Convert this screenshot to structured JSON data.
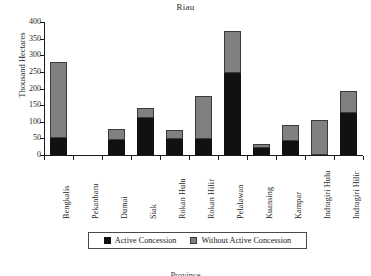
{
  "chart_data": {
    "type": "bar",
    "subtype": "stacked-vertical",
    "title": "Riau",
    "xlabel": "",
    "ylabel": "Thousand Hectares",
    "ylim": [
      0,
      400
    ],
    "yticks": [
      0,
      50,
      100,
      150,
      200,
      250,
      300,
      350,
      400
    ],
    "ytick_labels": [
      "0",
      "50",
      "100",
      "150",
      "200",
      "250",
      "300",
      "350",
      "400"
    ],
    "grid": false,
    "legend_position": "bottom-center",
    "categories": [
      "Bengkalis",
      "Pekanbaru",
      "Dumai",
      "Siak",
      "Rokan Hulu",
      "Rokan Hilir",
      "Pelalawan",
      "Kuansing",
      "Kampar",
      "Indragiri Hulu",
      "Indragiri Hilir"
    ],
    "series": [
      {
        "name": "Active Concession",
        "color": "#111111",
        "values": [
          50,
          0,
          46,
          110,
          48,
          49,
          247,
          22,
          42,
          0,
          125
        ]
      },
      {
        "name": "Without Active Concession",
        "color": "#808080",
        "values": [
          230,
          0,
          32,
          32,
          27,
          128,
          125,
          10,
          48,
          105,
          67
        ]
      }
    ],
    "totals": [
      280,
      0,
      78,
      142,
      75,
      177,
      372,
      32,
      90,
      105,
      192
    ]
  },
  "legend": {
    "entries": [
      {
        "label": "Active Concession",
        "swatch": "black-square-icon"
      },
      {
        "label": "Without Active Concession",
        "swatch": "gray-square-icon"
      }
    ]
  },
  "bottom_caption": "Province"
}
